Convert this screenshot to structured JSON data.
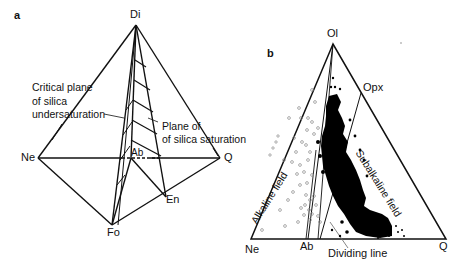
{
  "figure": {
    "panel_a": {
      "panel_label": "a",
      "vertices": {
        "di": "Di",
        "ne": "Ne",
        "q": "Q",
        "fo": "Fo",
        "en": "En",
        "ab": "Ab"
      },
      "annotations": {
        "critical_plane_line1": "Critical plane",
        "critical_plane_line2": "of silica",
        "critical_plane_line3": "undersaturation",
        "saturation_plane_line1": "Plane of",
        "saturation_plane_line2": "of silica saturation"
      }
    },
    "panel_b": {
      "panel_label": "b",
      "vertices": {
        "ol": "Ol",
        "ne": "Ne",
        "q": "Q",
        "ab": "Ab",
        "opx": "Opx"
      },
      "fields": {
        "alkaline": "Alkaline field",
        "subalkaline": "Subalkaline field"
      },
      "dividing_line_label": "Dividing line",
      "legend": {
        "open_symbols": "alkaline samples (open circles)",
        "filled_symbols": "subalkaline samples (filled dots)"
      },
      "colors": {
        "line": "#111111",
        "open_symbol": "#8a8a8a",
        "filled_symbol": "#000000"
      }
    }
  }
}
